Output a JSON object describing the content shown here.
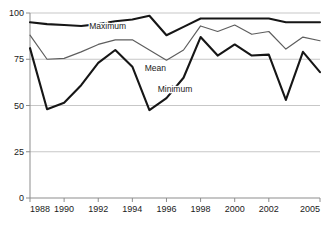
{
  "chart_data": {
    "type": "line",
    "title": "",
    "subtitle": "",
    "xlabel": "",
    "ylabel": "",
    "x": [
      1988,
      1989,
      1990,
      1991,
      1992,
      1993,
      1994,
      1995,
      1996,
      1997,
      1998,
      1999,
      2000,
      2001,
      2002,
      2003,
      2004,
      2005
    ],
    "xlim": [
      1988,
      2005
    ],
    "ylim": [
      0,
      100
    ],
    "xticks": [
      1988,
      1990,
      1992,
      1994,
      1996,
      1998,
      2000,
      2002,
      2005
    ],
    "xtick_labels": [
      "1988",
      "1990",
      "1992",
      "1994",
      "1996",
      "1998",
      "2000",
      "2002",
      "2005"
    ],
    "yticks": [
      0,
      25,
      50,
      75,
      100
    ],
    "ytick_labels": [
      "0",
      "25",
      "50",
      "75",
      "100"
    ],
    "grid": "horizontal",
    "legend_position": "inline-annotations",
    "series": [
      {
        "name": "Maximum",
        "color": "#161616",
        "width": 2.1,
        "label_x": 1992.55,
        "label_y": 91.2,
        "values": [
          95,
          94,
          93.5,
          93,
          94,
          95.5,
          96.5,
          98.5,
          88,
          92.5,
          97,
          97,
          97,
          97,
          97,
          95,
          95,
          95
        ]
      },
      {
        "name": "Mean",
        "color": "#5e5e5e",
        "width": 1.2,
        "label_x": 1995.35,
        "label_y": 68.5,
        "values": [
          88,
          75,
          75.5,
          79,
          83,
          85.5,
          85.5,
          80,
          74.5,
          80,
          93,
          90,
          93.5,
          88.5,
          90,
          80.5,
          87,
          85
        ]
      },
      {
        "name": "Minimum",
        "color": "#161616",
        "width": 2.1,
        "label_x": 1996.5,
        "label_y": 57.5,
        "values": [
          81,
          48,
          51.5,
          61,
          73,
          80,
          71,
          47.5,
          54,
          65,
          87,
          77,
          83,
          77,
          77.5,
          53,
          79,
          68
        ]
      }
    ]
  },
  "axes": {
    "y_axis_name": "value-axis",
    "x_axis_name": "year-axis"
  }
}
